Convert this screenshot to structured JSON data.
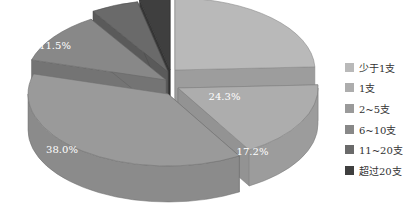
{
  "chart_data": {
    "type": "pie",
    "style": "3d-exploded",
    "title": "",
    "categories": [
      "少于1支",
      "1支",
      "2~5支",
      "6~10支",
      "11~20支",
      "超过20支"
    ],
    "values": [
      24.3,
      17.2,
      38.0,
      11.5,
      5.5,
      3.5
    ],
    "labels": [
      "24.3%",
      "17.2%",
      "38.0%",
      "11.5%",
      "5.5%",
      "3.5%"
    ],
    "colors": [
      "#b9b9b9",
      "#adadad",
      "#9a9a9a",
      "#888888",
      "#6a6a6a",
      "#3f3f3f"
    ],
    "legend_position": "right"
  },
  "legend": {
    "items": [
      {
        "label": "少于1支",
        "color": "#b9b9b9"
      },
      {
        "label": "1支",
        "color": "#adadad"
      },
      {
        "label": "2~5支",
        "color": "#9a9a9a"
      },
      {
        "label": "6~10支",
        "color": "#888888"
      },
      {
        "label": "11~20支",
        "color": "#6a6a6a"
      },
      {
        "label": "超过20支",
        "color": "#3f3f3f"
      }
    ]
  }
}
